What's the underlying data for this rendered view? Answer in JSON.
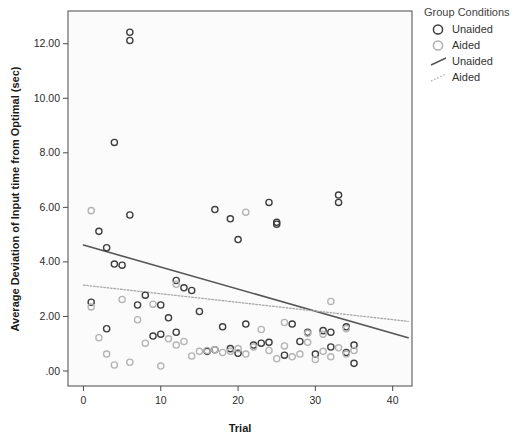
{
  "chart_data": {
    "type": "scatter",
    "title": "",
    "xlabel": "Trial",
    "ylabel": "Average Deviation of Input time from Optimal (sec)",
    "xlim": [
      -2,
      42.5
    ],
    "ylim": [
      -0.55,
      13.2
    ],
    "xticks": [
      0,
      10,
      20,
      30,
      40
    ],
    "xticklabels": [
      "0",
      "10",
      "20",
      "30",
      "40"
    ],
    "yticks": [
      0,
      2,
      4,
      6,
      8,
      10,
      12
    ],
    "yticklabels": [
      ".00",
      "2.00",
      "4.00",
      "6.00",
      "8.00",
      "10.00",
      "12.00"
    ],
    "grid": false,
    "legend": {
      "title": "Group Conditions",
      "position": "right-top",
      "entries": [
        {
          "label": "Unaided",
          "type": "marker",
          "marker": "open-circle",
          "color": "#3d3d3d"
        },
        {
          "label": "Aided",
          "type": "marker",
          "marker": "open-circle",
          "color": "#b0b0b0"
        },
        {
          "label": "Unaided",
          "type": "line",
          "style": "solid",
          "color": "#555555"
        },
        {
          "label": "Aided",
          "type": "line",
          "style": "dotted",
          "color": "#aaaaaa"
        }
      ]
    },
    "series": [
      {
        "name": "Unaided",
        "marker": "open-circle",
        "color": "#3d3d3d",
        "points": [
          [
            1,
            2.52
          ],
          [
            2,
            5.12
          ],
          [
            3,
            4.52
          ],
          [
            3,
            1.55
          ],
          [
            4,
            8.38
          ],
          [
            4,
            3.92
          ],
          [
            5,
            3.88
          ],
          [
            6,
            12.42
          ],
          [
            6,
            12.12
          ],
          [
            6,
            5.72
          ],
          [
            7,
            2.42
          ],
          [
            8,
            2.78
          ],
          [
            9,
            1.28
          ],
          [
            10,
            2.42
          ],
          [
            10,
            1.35
          ],
          [
            11,
            1.95
          ],
          [
            12,
            3.32
          ],
          [
            12,
            1.42
          ],
          [
            13,
            3.05
          ],
          [
            14,
            2.95
          ],
          [
            15,
            2.18
          ],
          [
            16,
            0.72
          ],
          [
            17,
            5.92
          ],
          [
            17,
            0.78
          ],
          [
            18,
            1.62
          ],
          [
            19,
            5.58
          ],
          [
            19,
            0.82
          ],
          [
            20,
            4.82
          ],
          [
            20,
            0.65
          ],
          [
            21,
            1.72
          ],
          [
            22,
            0.95
          ],
          [
            23,
            1.02
          ],
          [
            24,
            6.18
          ],
          [
            24,
            1.05
          ],
          [
            25,
            5.45
          ],
          [
            25,
            5.38
          ],
          [
            26,
            0.58
          ],
          [
            27,
            1.72
          ],
          [
            28,
            1.08
          ],
          [
            29,
            1.42
          ],
          [
            30,
            0.62
          ],
          [
            31,
            1.48
          ],
          [
            32,
            1.42
          ],
          [
            32,
            0.88
          ],
          [
            33,
            6.45
          ],
          [
            33,
            6.18
          ],
          [
            34,
            1.62
          ],
          [
            34,
            0.68
          ],
          [
            35,
            0.28
          ],
          [
            35,
            0.95
          ]
        ]
      },
      {
        "name": "Aided",
        "marker": "open-circle",
        "color": "#b4b4b4",
        "points": [
          [
            1,
            5.88
          ],
          [
            1,
            2.35
          ],
          [
            2,
            1.22
          ],
          [
            3,
            0.62
          ],
          [
            4,
            0.22
          ],
          [
            5,
            2.62
          ],
          [
            6,
            0.32
          ],
          [
            7,
            1.88
          ],
          [
            8,
            1.02
          ],
          [
            9,
            2.45
          ],
          [
            10,
            0.18
          ],
          [
            11,
            1.18
          ],
          [
            12,
            3.18
          ],
          [
            12,
            0.95
          ],
          [
            13,
            1.08
          ],
          [
            14,
            0.55
          ],
          [
            15,
            0.72
          ],
          [
            16,
            0.75
          ],
          [
            17,
            0.78
          ],
          [
            18,
            0.68
          ],
          [
            19,
            0.72
          ],
          [
            20,
            0.82
          ],
          [
            21,
            0.62
          ],
          [
            21,
            5.82
          ],
          [
            22,
            0.88
          ],
          [
            23,
            1.52
          ],
          [
            24,
            0.75
          ],
          [
            25,
            0.45
          ],
          [
            26,
            0.92
          ],
          [
            26,
            1.78
          ],
          [
            27,
            0.52
          ],
          [
            28,
            0.62
          ],
          [
            29,
            1.05
          ],
          [
            29,
            1.38
          ],
          [
            30,
            0.42
          ],
          [
            31,
            1.35
          ],
          [
            31,
            0.72
          ],
          [
            32,
            2.55
          ],
          [
            32,
            0.52
          ],
          [
            33,
            0.85
          ],
          [
            34,
            1.55
          ],
          [
            34,
            0.62
          ],
          [
            35,
            0.75
          ]
        ]
      }
    ],
    "fit_lines": [
      {
        "name": "Unaided",
        "style": "solid",
        "color": "#555555",
        "x0": 0,
        "y0": 4.62,
        "x1": 42,
        "y1": 1.22
      },
      {
        "name": "Aided",
        "style": "dotted",
        "color": "#a8a8a8",
        "x0": 0,
        "y0": 3.15,
        "x1": 42,
        "y1": 1.82
      }
    ]
  }
}
